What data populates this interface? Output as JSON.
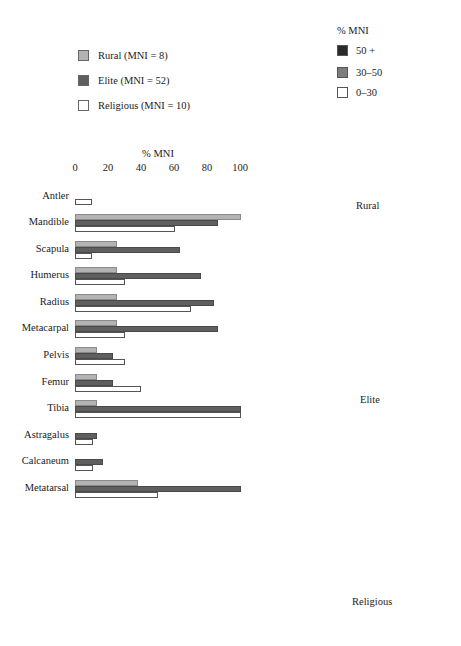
{
  "legend": {
    "series": [
      {
        "label": "Rural (MNI = 8)",
        "color": "#b3b3b3"
      },
      {
        "label": "Elite (MNI = 52)",
        "color": "#5f5f5f"
      },
      {
        "label": "Religious (MNI = 10)",
        "color": "#ffffff"
      }
    ]
  },
  "skeleton_legend": {
    "title": "% MNI",
    "items": [
      {
        "label": "50 +",
        "color": "#2b2b2b"
      },
      {
        "label": "30–50",
        "color": "#7d7d7d"
      },
      {
        "label": "0–30",
        "color": "#ffffff"
      }
    ]
  },
  "axis": {
    "title": "% MNI",
    "ticks": [
      "0",
      "20",
      "40",
      "60",
      "80",
      "100"
    ]
  },
  "panels": [
    {
      "label": "Rural"
    },
    {
      "label": "Elite"
    },
    {
      "label": "Religious"
    }
  ],
  "chart_data": {
    "type": "bar",
    "orientation": "horizontal",
    "title": "",
    "xlabel": "% MNI",
    "ylabel": "",
    "xlim": [
      0,
      100
    ],
    "xticks": [
      0,
      20,
      40,
      60,
      80,
      100
    ],
    "axis_position": "top",
    "grid": false,
    "legend_position": "top-left",
    "categories": [
      "Antler",
      "Mandible",
      "Scapula",
      "Humerus",
      "Radius",
      "Metacarpal",
      "Pelvis",
      "Femur",
      "Tibia",
      "Astragalus",
      "Calcaneum",
      "Metatarsal"
    ],
    "series": [
      {
        "name": "Rural (MNI = 8)",
        "color": "#b3b3b3",
        "values": [
          0,
          100,
          25,
          25,
          25,
          25,
          13,
          13,
          13,
          0,
          0,
          38
        ]
      },
      {
        "name": "Elite (MNI = 52)",
        "color": "#5f5f5f",
        "values": [
          0,
          86,
          63,
          76,
          84,
          86,
          23,
          23,
          100,
          13,
          17,
          100
        ]
      },
      {
        "name": "Religious (MNI = 10)",
        "color": "#ffffff",
        "values": [
          10,
          60,
          10,
          30,
          70,
          30,
          30,
          40,
          100,
          11,
          11,
          50
        ]
      }
    ],
    "annotations": [
      "Skeleton diagrams shaded by % MNI: Rural, Elite, Religious"
    ]
  }
}
